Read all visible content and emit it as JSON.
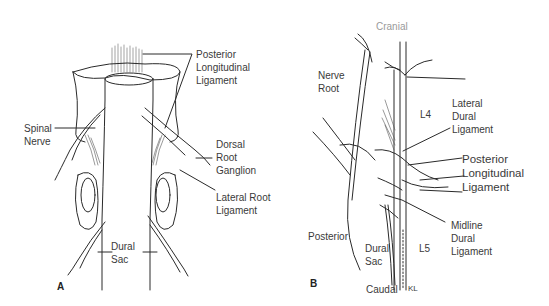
{
  "panels": [
    {
      "id": "A",
      "letter": "A",
      "labels": {
        "posterior_longitudinal_ligament": "Posterior\nLongitudinal\nLigament",
        "spinal_nerve": "Spinal\nNerve",
        "dorsal_root_ganglion": "Dorsal\nRoot\nGanglion",
        "lateral_root_ligament": "Lateral Root\nLigament",
        "dural_sac": "Dural\nSac"
      }
    },
    {
      "id": "B",
      "letter": "B",
      "labels": {
        "cranial": "Cranial",
        "nerve_root": "Nerve\nRoot",
        "l4": "L4",
        "lateral_dural_ligament": "Lateral\nDural\nLigament",
        "posterior_longitudinal_ligament": "Posterior\nLongitudinal\nLigament",
        "midline_dural_ligament": "Midline\nDural\nLigament",
        "posterior": "Posterior",
        "dural_sac": "Dural\nSac",
        "l5": "L5",
        "caudal": "Caudal",
        "signature": "KL"
      }
    }
  ]
}
